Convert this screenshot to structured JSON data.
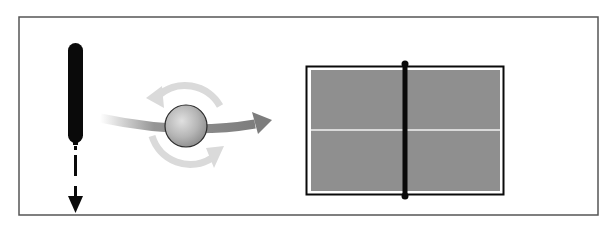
{
  "diagram": {
    "elements": {
      "paddle": {
        "label": "paddle",
        "motion": "downward",
        "color": "#0a0a0a"
      },
      "ball": {
        "label": "ball",
        "spin": "rotating",
        "color": "#b8b8b8"
      },
      "trajectory": {
        "label": "ball trajectory",
        "direction": "right",
        "color": "#8a8a8a"
      },
      "spin_arrows": {
        "label": "spin arrows",
        "count": 2,
        "color": "#d9d9d9"
      },
      "table": {
        "label": "table (top view)",
        "surface_color": "#8f8f8f",
        "line_color": "#f2f2f2",
        "net_color": "#0a0a0a"
      },
      "frame": {
        "border_color": "#555555"
      }
    }
  }
}
